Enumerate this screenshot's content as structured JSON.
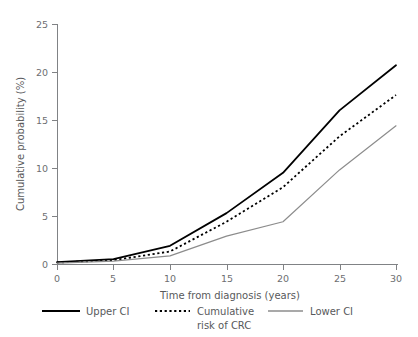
{
  "chart_data": {
    "type": "line",
    "title": "",
    "xlabel": "Time from diagnosis (years)",
    "ylabel": "Cumulative probability (%)",
    "xlim": [
      0,
      30
    ],
    "ylim": [
      0,
      25
    ],
    "xticks": [
      0,
      5,
      10,
      15,
      20,
      25,
      30
    ],
    "yticks": [
      0,
      5,
      10,
      15,
      20,
      25
    ],
    "xtick_labels": [
      "0",
      "5",
      "10",
      "15",
      "20",
      "25",
      "30"
    ],
    "ytick_labels": [
      "0",
      "5",
      "10",
      "15",
      "20",
      "25"
    ],
    "grid": false,
    "legend_position": "bottom",
    "x": [
      0,
      5,
      10,
      15,
      20,
      25,
      30
    ],
    "series": [
      {
        "name": "Upper CI",
        "values": [
          0.2,
          0.5,
          1.9,
          5.3,
          9.5,
          16.0,
          20.7
        ],
        "color": "#000000",
        "style": "solid",
        "width": 1.8
      },
      {
        "name": "Cumulative risk of CRC",
        "values": [
          0.15,
          0.4,
          1.3,
          4.4,
          8.0,
          13.3,
          17.6
        ],
        "color": "#000000",
        "style": "dotted",
        "width": 1.8
      },
      {
        "name": "Lower CI",
        "values": [
          0.1,
          0.3,
          0.85,
          2.9,
          4.4,
          9.8,
          14.4
        ],
        "color": "#8c8c8c",
        "style": "solid",
        "width": 1.2
      }
    ]
  },
  "legend": {
    "items": [
      {
        "label": "Upper CI",
        "label2": "",
        "swatch": "solid-black"
      },
      {
        "label": "Cumulative",
        "label2": "risk of CRC",
        "swatch": "dotted-black"
      },
      {
        "label": "Lower CI",
        "label2": "",
        "swatch": "solid-gray"
      }
    ]
  },
  "colors": {
    "upper_ci": "#000000",
    "cumulative_risk": "#000000",
    "lower_ci": "#8c8c8c",
    "axis": "#808285",
    "text": "#58595b",
    "background": "#ffffff"
  }
}
